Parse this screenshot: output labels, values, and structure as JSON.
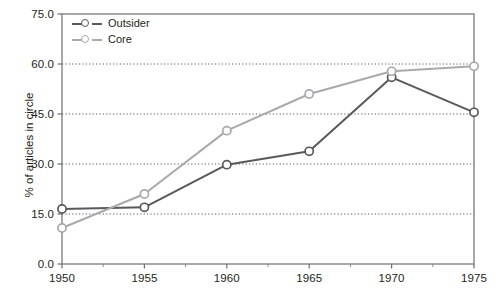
{
  "chart_data": {
    "type": "line",
    "title": "",
    "xlabel": "",
    "ylabel": "% of articles in circle",
    "x": [
      1950,
      1955,
      1960,
      1965,
      1970,
      1975
    ],
    "xtick_labels": [
      "1950",
      "1955",
      "1960",
      "1965",
      "1970",
      "1975"
    ],
    "ytick_labels": [
      "0.0",
      "15.0",
      "30.0",
      "45.0",
      "60.0",
      "75.0"
    ],
    "ytick_values": [
      0,
      15,
      30,
      45,
      60,
      75
    ],
    "xlim": [
      1950,
      1975
    ],
    "ylim": [
      0,
      75
    ],
    "grid": "horizontal-dotted",
    "legend_position": "top-left-inside",
    "series": [
      {
        "name": "Outsider",
        "color": "#58595b",
        "marker": "open-circle",
        "values": [
          16.5,
          17.0,
          29.8,
          33.8,
          56.0,
          45.5
        ]
      },
      {
        "name": "Core",
        "color": "#a7a9ac",
        "marker": "open-circle",
        "values": [
          10.8,
          21.0,
          40.0,
          51.0,
          57.8,
          59.3
        ]
      }
    ]
  },
  "axes": {
    "y_title": "% of articles in circle"
  },
  "legend": {
    "items": [
      {
        "label": "Outsider",
        "color": "#58595b"
      },
      {
        "label": "Core",
        "color": "#a7a9ac"
      }
    ]
  }
}
